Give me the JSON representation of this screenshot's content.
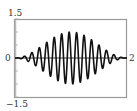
{
  "chart_data": {
    "type": "line",
    "title": "",
    "xlabel": "",
    "ylabel": "",
    "xlim": [
      0,
      2
    ],
    "ylim": [
      -1.5,
      1.5
    ],
    "grid": false,
    "legend": null,
    "tick_labels": {
      "y_top": "1.5",
      "y_bottom": "−1.5",
      "y_zero": "0",
      "x_right": "2"
    },
    "series": [
      {
        "name": "f(x)",
        "description": "amplitude-modulated oscillation, envelope sin(pi x), about 15 peaks over [0,2]",
        "envelope": "sin(pi*x)",
        "carrier_cycles": 15,
        "max_amplitude": 1.0
      }
    ],
    "colors": {
      "curve": "#111111",
      "frame": "#999999",
      "axis": "#222222"
    }
  }
}
